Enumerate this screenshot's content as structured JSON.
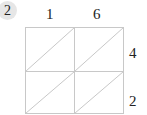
{
  "problem_number": "2",
  "top_digits": [
    "1",
    "6"
  ],
  "right_digits": [
    "4",
    "2"
  ],
  "grid": {
    "rows": 2,
    "cols": 2,
    "line_color": "#c8c8c8"
  }
}
